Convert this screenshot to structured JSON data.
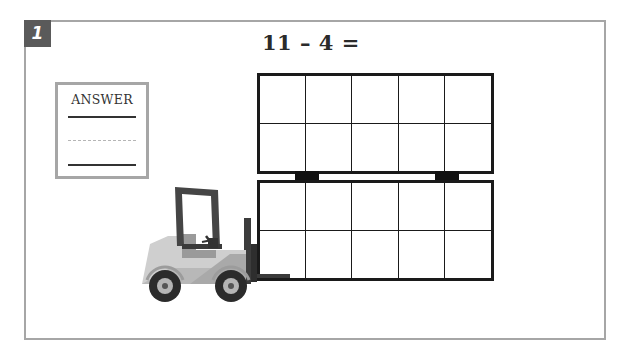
{
  "problem": {
    "number": "1",
    "equation": "11 – 4 ="
  },
  "answer_box": {
    "label": "ANSWER",
    "value": ""
  },
  "ten_frames": {
    "count": 2,
    "rows": 2,
    "columns": 5,
    "filled_cells": [
      0,
      0
    ]
  },
  "illustration": {
    "name": "forklift",
    "description": "Forklift carrying two stacked ten-frames"
  },
  "colors": {
    "badge_bg": "#5a5a5a",
    "card_border": "#a6a6a6",
    "frame_border": "#1a1a1a",
    "forklift_body": "#c8c8c8",
    "forklift_dark": "#3c3c3c"
  }
}
